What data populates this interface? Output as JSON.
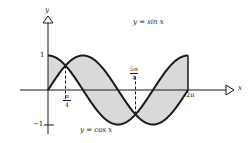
{
  "chart_data": {
    "type": "line",
    "title": "",
    "xlabel": "x",
    "ylabel": "y",
    "xlim": [
      0,
      6.2832
    ],
    "ylim": [
      -1,
      1
    ],
    "grid": false,
    "series": [
      {
        "name": "y = sin x",
        "function": "sin",
        "x_range": [
          0,
          6.2832
        ]
      },
      {
        "name": "y = cos x",
        "function": "cos",
        "x_range": [
          0,
          6.2832
        ]
      }
    ],
    "shaded_region": "area between y = sin x and y = cos x on [0, 2π]",
    "intersections": [
      {
        "x_label": "π/4",
        "x": 0.7854,
        "y": 0.7071
      },
      {
        "x_label": "5π/4",
        "x": 3.927,
        "y": -0.7071
      }
    ],
    "x_ticks": [
      {
        "label_num": "π",
        "label_den": "4",
        "value": 0.7854
      },
      {
        "label_num": "5π",
        "label_den": "4",
        "value": 3.927
      },
      {
        "label": "2π",
        "value": 6.2832
      }
    ],
    "y_ticks": [
      {
        "label": "1",
        "value": 1
      },
      {
        "label": "−1",
        "value": -1
      }
    ],
    "annotations": [
      "y = sin x",
      "y = cos x"
    ],
    "colors": {
      "curve": "#1a1a1a",
      "shade": "#d9d9d9",
      "axis": "#1a1a1a"
    }
  },
  "labels": {
    "y_axis": "y",
    "x_axis": "x",
    "sin_label": "y = sin x",
    "cos_label": "y = cos x",
    "tick_one": "1",
    "tick_neg_one": "−1",
    "tick_pi4_num": "π",
    "tick_pi4_den": "4",
    "tick_5pi4_num": "5π",
    "tick_5pi4_den": "4",
    "tick_2pi": "2π"
  }
}
